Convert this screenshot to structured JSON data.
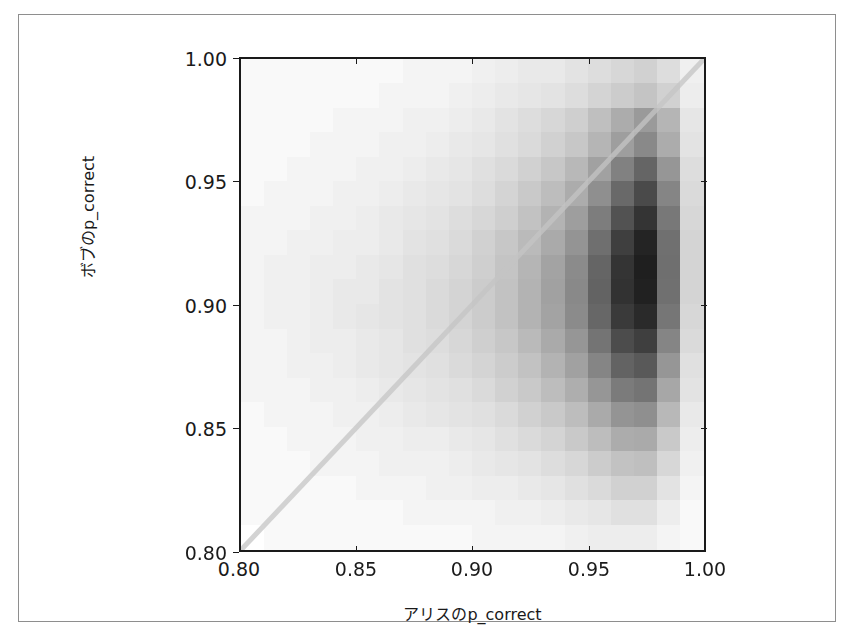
{
  "figure": {
    "background_color": "#ffffff",
    "frame_color": "#8e8e8e",
    "axis_color": "#1a1a1a"
  },
  "axis_labels": {
    "x": "アリスのp_correct",
    "y": "ボブのp_correct"
  },
  "ticks": {
    "x": [
      "0.80",
      "0.85",
      "0.90",
      "0.95",
      "1.00"
    ],
    "y": [
      "0.80",
      "0.85",
      "0.90",
      "0.95",
      "1.00"
    ]
  },
  "chart_data": {
    "type": "heatmap",
    "title": "",
    "xlabel": "アリスのp_correct",
    "ylabel": "ボブのp_correct",
    "xlim": [
      0.8,
      1.0
    ],
    "ylim": [
      0.8,
      1.0
    ],
    "xticks": [
      0.8,
      0.85,
      0.9,
      0.95,
      1.0
    ],
    "yticks": [
      0.8,
      0.85,
      0.9,
      0.95,
      1.0
    ],
    "xticklabels": [
      "0.80",
      "0.85",
      "0.90",
      "0.95",
      "1.00"
    ],
    "yticklabels": [
      "0.80",
      "0.85",
      "0.90",
      "0.95",
      "1.00"
    ],
    "grid": false,
    "legend": false,
    "colormap": "greys",
    "colormap_low": "#ffffff",
    "colormap_high": "#1f1f1f",
    "bin_size": 0.01,
    "x_bin_edges": [
      0.8,
      0.81,
      0.82,
      0.83,
      0.84,
      0.85,
      0.86,
      0.87,
      0.88,
      0.89,
      0.9,
      0.91,
      0.92,
      0.93,
      0.94,
      0.95,
      0.96,
      0.97,
      0.98,
      0.99,
      1.0
    ],
    "y_bin_edges": [
      0.8,
      0.81,
      0.82,
      0.83,
      0.84,
      0.85,
      0.86,
      0.87,
      0.88,
      0.89,
      0.9,
      0.91,
      0.92,
      0.93,
      0.94,
      0.95,
      0.96,
      0.97,
      0.98,
      0.99,
      1.0
    ],
    "value_range": [
      0,
      100
    ],
    "note": "density matrix rows are top (y=0.99-1.00) to bottom (y=0.80-0.81); columns are left (x=0.80-0.81) to right (x=0.99-1.00)",
    "density": [
      [
        1,
        1,
        1,
        1,
        1,
        1,
        1,
        2,
        2,
        2,
        3,
        4,
        5,
        5,
        7,
        9,
        11,
        13,
        9,
        3
      ],
      [
        1,
        1,
        1,
        1,
        1,
        1,
        2,
        2,
        2,
        3,
        4,
        5,
        6,
        7,
        9,
        12,
        15,
        18,
        13,
        4
      ],
      [
        1,
        1,
        1,
        1,
        2,
        2,
        2,
        3,
        3,
        4,
        5,
        7,
        9,
        11,
        14,
        20,
        28,
        36,
        24,
        6
      ],
      [
        1,
        1,
        1,
        2,
        2,
        2,
        3,
        3,
        4,
        5,
        6,
        8,
        10,
        13,
        17,
        24,
        34,
        44,
        28,
        7
      ],
      [
        1,
        1,
        2,
        2,
        2,
        3,
        3,
        4,
        5,
        6,
        8,
        10,
        13,
        17,
        23,
        33,
        48,
        62,
        38,
        9
      ],
      [
        1,
        2,
        2,
        2,
        3,
        3,
        4,
        5,
        6,
        7,
        9,
        12,
        16,
        21,
        28,
        41,
        60,
        76,
        46,
        10
      ],
      [
        2,
        2,
        2,
        3,
        3,
        4,
        5,
        6,
        7,
        9,
        11,
        14,
        19,
        25,
        34,
        50,
        72,
        88,
        52,
        11
      ],
      [
        2,
        2,
        3,
        3,
        4,
        4,
        5,
        7,
        8,
        10,
        13,
        17,
        22,
        29,
        39,
        57,
        82,
        97,
        56,
        12
      ],
      [
        2,
        3,
        3,
        4,
        4,
        5,
        6,
        8,
        9,
        11,
        14,
        18,
        24,
        32,
        43,
        62,
        88,
        100,
        57,
        12
      ],
      [
        2,
        3,
        3,
        4,
        5,
        5,
        7,
        8,
        10,
        12,
        15,
        19,
        25,
        33,
        44,
        63,
        89,
        99,
        56,
        12
      ],
      [
        2,
        3,
        3,
        4,
        5,
        6,
        7,
        8,
        10,
        12,
        15,
        19,
        25,
        32,
        43,
        61,
        85,
        94,
        53,
        11
      ],
      [
        2,
        2,
        3,
        4,
        4,
        5,
        6,
        8,
        9,
        11,
        14,
        17,
        22,
        29,
        38,
        54,
        75,
        82,
        46,
        10
      ],
      [
        2,
        2,
        3,
        3,
        4,
        5,
        6,
        7,
        8,
        10,
        12,
        15,
        19,
        25,
        33,
        46,
        63,
        68,
        38,
        8
      ],
      [
        2,
        2,
        2,
        3,
        3,
        4,
        5,
        6,
        7,
        8,
        10,
        13,
        16,
        21,
        27,
        38,
        51,
        54,
        30,
        7
      ],
      [
        1,
        2,
        2,
        2,
        3,
        3,
        4,
        5,
        6,
        7,
        8,
        10,
        13,
        16,
        21,
        29,
        39,
        41,
        23,
        5
      ],
      [
        1,
        1,
        2,
        2,
        2,
        3,
        3,
        4,
        4,
        5,
        6,
        8,
        10,
        12,
        16,
        21,
        28,
        29,
        16,
        4
      ],
      [
        1,
        1,
        1,
        2,
        2,
        2,
        3,
        3,
        3,
        4,
        5,
        6,
        7,
        9,
        11,
        15,
        19,
        20,
        11,
        3
      ],
      [
        1,
        1,
        1,
        1,
        1,
        2,
        2,
        2,
        3,
        3,
        4,
        4,
        5,
        6,
        8,
        10,
        13,
        13,
        7,
        2
      ],
      [
        1,
        1,
        1,
        1,
        1,
        1,
        1,
        2,
        2,
        2,
        2,
        3,
        3,
        4,
        5,
        6,
        8,
        8,
        4,
        1
      ],
      [
        0,
        1,
        1,
        1,
        1,
        1,
        1,
        1,
        1,
        1,
        2,
        2,
        2,
        2,
        3,
        4,
        4,
        4,
        2,
        1
      ]
    ],
    "reference_line": {
      "name": "identity-line",
      "description": "y = x diagonal reference line",
      "from": [
        0.8,
        0.8
      ],
      "to": [
        1.0,
        1.0
      ],
      "color": "#c4c4c4",
      "linewidth": 5
    }
  }
}
